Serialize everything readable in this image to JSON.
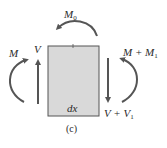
{
  "diagram": {
    "type": "free-body-diagram",
    "element": {
      "label": "dx",
      "fill_color": "#d9d9d9",
      "border_color": "#555555"
    },
    "labels": {
      "applied_moment": {
        "base": "M",
        "sub": "0"
      },
      "left_moment": {
        "base": "M",
        "sub": ""
      },
      "left_shear": {
        "base": "V",
        "sub": ""
      },
      "right_moment": {
        "base": "M + M",
        "sub": "1"
      },
      "right_shear": {
        "base": "V + V",
        "sub": "1"
      }
    },
    "caption": "(c)",
    "arrow_color": "#555555"
  }
}
